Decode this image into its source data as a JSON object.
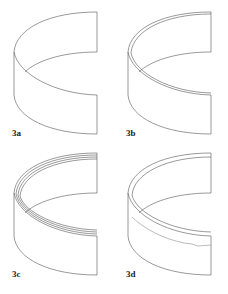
{
  "figure": {
    "panels": [
      {
        "id": "3a",
        "label": "3a",
        "rings": 1,
        "inner_band": false
      },
      {
        "id": "3b",
        "label": "3b",
        "rings": 2,
        "inner_band": false
      },
      {
        "id": "3c",
        "label": "3c",
        "rings": 4,
        "inner_band": false
      },
      {
        "id": "3d",
        "label": "3d",
        "rings": 2,
        "inner_band": true
      }
    ],
    "colors": {
      "stroke": "#555555",
      "band": "#aaaaaa",
      "background": "#ffffff"
    }
  }
}
